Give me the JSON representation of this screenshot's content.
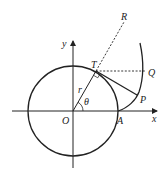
{
  "diagram": {
    "type": "geometry",
    "labels": {
      "x_axis": "x",
      "y_axis": "y",
      "origin": "O",
      "point_A": "A",
      "point_T": "T",
      "point_R": "R",
      "point_Q": "Q",
      "point_P": "P",
      "radius": "r",
      "angle": "θ"
    },
    "colors": {
      "stroke": "#222222",
      "background": "#ffffff"
    }
  }
}
